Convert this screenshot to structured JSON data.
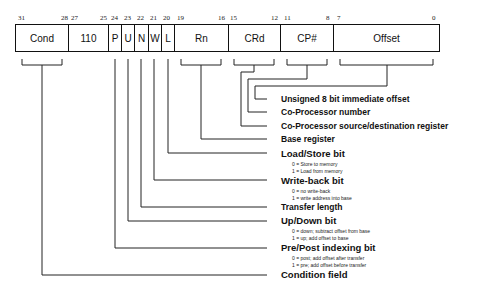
{
  "instruction_format": {
    "fields": [
      {
        "name": "Cond",
        "hi": "31",
        "lo": "28"
      },
      {
        "name": "110",
        "hi": "27",
        "lo": "25"
      },
      {
        "name": "P",
        "hi": "24",
        "lo": ""
      },
      {
        "name": "U",
        "hi": "23",
        "lo": ""
      },
      {
        "name": "N",
        "hi": "22",
        "lo": ""
      },
      {
        "name": "W",
        "hi": "21",
        "lo": ""
      },
      {
        "name": "L",
        "hi": "20",
        "lo": ""
      },
      {
        "name": "Rn",
        "hi": "19",
        "lo": "16"
      },
      {
        "name": "CRd",
        "hi": "15",
        "lo": "12"
      },
      {
        "name": "CP#",
        "hi": "11",
        "lo": "8"
      },
      {
        "name": "Offset",
        "hi": "7",
        "lo": "0"
      }
    ]
  },
  "labels": {
    "offset": {
      "title": "Unsigned 8 bit immediate offset"
    },
    "cpnum": {
      "title": "Co-Processor number"
    },
    "crd": {
      "title": "Co-Processor source/destination register"
    },
    "rn": {
      "title": "Base register"
    },
    "l": {
      "title": "Load/Store bit",
      "sub0": "0 = Store to memory",
      "sub1": "1 = Load from memory"
    },
    "w": {
      "title": "Write-back bit",
      "sub0": "0 = no write-back",
      "sub1": "1 = write address into base"
    },
    "n": {
      "title": "Transfer length"
    },
    "u": {
      "title": "Up/Down bit",
      "sub0": "0 = down; subtract offset from base",
      "sub1": "1 = up; add offset to base"
    },
    "p": {
      "title": "Pre/Post indexing bit",
      "sub0": "0 = post; add offset after transfer",
      "sub1": "1 = pre; add offset before transfer"
    },
    "cond": {
      "title": "Condition field"
    }
  }
}
